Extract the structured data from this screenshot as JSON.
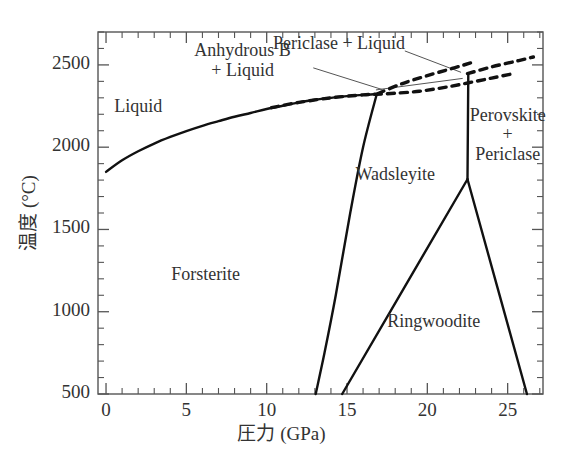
{
  "chart_data": {
    "type": "line",
    "title": "",
    "xlabel": "圧力 (GPa)",
    "ylabel": "温度 (°C)",
    "xlim": [
      -0.5,
      27.2
    ],
    "ylim": [
      500,
      2700
    ],
    "xticks": [
      0,
      5,
      10,
      15,
      20,
      25
    ],
    "xtick_labels": [
      "0",
      "5",
      "10",
      "15",
      "20",
      "25"
    ],
    "x_minor_step": 1,
    "yticks": [
      500,
      1000,
      1500,
      2000,
      2500
    ],
    "ytick_labels": [
      "500",
      "1000",
      "1500",
      "2000",
      "2500"
    ],
    "y_minor_step": 100,
    "grid": false,
    "legend": "none",
    "series": [
      {
        "name": "liquidus (Forsterite + Liquid)",
        "style": "solid",
        "points": [
          [
            0,
            1850
          ],
          [
            1,
            1920
          ],
          [
            2,
            1975
          ],
          [
            3,
            2022
          ],
          [
            4,
            2062
          ],
          [
            5,
            2098
          ],
          [
            6,
            2130
          ],
          [
            7,
            2158
          ],
          [
            8,
            2185
          ],
          [
            9,
            2208
          ],
          [
            10,
            2232
          ],
          [
            11,
            2252
          ],
          [
            12,
            2272
          ],
          [
            13,
            2288
          ],
          [
            14,
            2300
          ],
          [
            15,
            2310
          ],
          [
            16,
            2318
          ],
          [
            16.85,
            2322
          ]
        ]
      },
      {
        "name": "Anhydrous B + Liquid boundary (dashed lower)",
        "style": "dashed",
        "points": [
          [
            10.3,
            2240
          ],
          [
            12,
            2272
          ],
          [
            14,
            2300
          ],
          [
            16,
            2318
          ],
          [
            16.85,
            2322
          ],
          [
            18,
            2328
          ],
          [
            19.5,
            2340
          ],
          [
            21,
            2362
          ],
          [
            22.5,
            2390
          ],
          [
            24,
            2420
          ],
          [
            25.4,
            2448
          ]
        ]
      },
      {
        "name": "Periclase + Liquid boundary (dashed upper)",
        "style": "dashed",
        "points": [
          [
            16.9,
            2325
          ],
          [
            18.4,
            2385
          ],
          [
            20,
            2435
          ],
          [
            21.6,
            2480
          ],
          [
            22.7,
            2512
          ]
        ]
      },
      {
        "name": "Periclase + Liquid boundary (dashed right)",
        "style": "dashed",
        "points": [
          [
            22.5,
            2447
          ],
          [
            24,
            2488
          ],
          [
            25.5,
            2522
          ],
          [
            26.6,
            2548
          ]
        ]
      },
      {
        "name": "Forsterite / Wadsleyite boundary",
        "style": "solid",
        "points": [
          [
            16.85,
            2322
          ],
          [
            16.0,
            2000
          ],
          [
            15.2,
            1600
          ],
          [
            14.3,
            1100
          ],
          [
            13.6,
            750
          ],
          [
            13.05,
            500
          ]
        ]
      },
      {
        "name": "Wadsleyite / Ringwoodite boundary",
        "style": "solid",
        "points": [
          [
            22.5,
            1805
          ],
          [
            14.7,
            500
          ]
        ]
      },
      {
        "name": "Perovskite + Periclase vertical boundary",
        "style": "solid",
        "points": [
          [
            22.55,
            2447
          ],
          [
            22.5,
            1805
          ]
        ]
      },
      {
        "name": "Ringwoodite / Perovskite+Periclase boundary",
        "style": "solid",
        "points": [
          [
            22.5,
            1805
          ],
          [
            26.2,
            500
          ]
        ]
      }
    ],
    "region_labels": [
      {
        "id": "liquid",
        "text": "Liquid",
        "x": 2.0,
        "y": 2240
      },
      {
        "id": "forsterite",
        "text": "Forsterite",
        "x": 6.2,
        "y": 1215
      },
      {
        "id": "wadsleyite",
        "text": "Wadsleyite",
        "x": 18.0,
        "y": 1822
      },
      {
        "id": "ringwoodite",
        "text": "Ringwoodite",
        "x": 20.4,
        "y": 930
      },
      {
        "id": "anhydrous-b-liquid",
        "text": "Anhydrous B\n+ Liquid",
        "x": 8.5,
        "y": 2510
      },
      {
        "id": "periclase-liquid",
        "text": "Periclase + Liquid",
        "x": 14.5,
        "y": 2620
      },
      {
        "id": "perovskite-periclase",
        "text": "Perovskite\n+\nPericlase",
        "x": 25.0,
        "y": 2050
      }
    ],
    "leader_lines": [
      {
        "id": "leader-periclase-liquid",
        "from": [
          18.6,
          2585
        ],
        "to": [
          22.1,
          2455
        ]
      },
      {
        "id": "leader-anhydrous-b",
        "from": [
          12.9,
          2482
        ],
        "to": [
          17.2,
          2350
        ]
      },
      {
        "id": "leader-anhydrous-b-2",
        "from": [
          16.8,
          2348
        ],
        "to": [
          22.2,
          2418
        ]
      }
    ]
  },
  "axes": {
    "x_title": "圧力 (GPa)",
    "y_title": "温度 (°C)",
    "x_tick_labels": [
      "0",
      "5",
      "10",
      "15",
      "20",
      "25"
    ],
    "y_tick_labels": [
      "2500",
      "2000",
      "1500",
      "1000",
      "500"
    ]
  },
  "colors": {
    "line": "#111111",
    "axis": "#444444",
    "text": "#333333",
    "background": "#ffffff"
  }
}
